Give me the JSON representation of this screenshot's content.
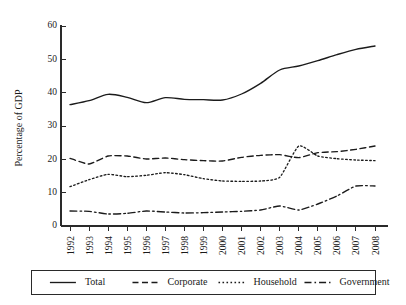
{
  "chart_data": {
    "type": "line",
    "title": "",
    "subtitle": "",
    "xlabel": "",
    "ylabel": "Percentage of GDP",
    "xlim": [
      1992,
      2008
    ],
    "ylim": [
      0,
      60
    ],
    "yticks": [
      0,
      10,
      20,
      30,
      40,
      50,
      60
    ],
    "ytick_labels": [
      "0",
      "10",
      "20",
      "30",
      "40",
      "50",
      "60"
    ],
    "grid": false,
    "legend_position": "bottom",
    "x": [
      1992,
      1993,
      1994,
      1995,
      1996,
      1997,
      1998,
      1999,
      2000,
      2001,
      2002,
      2003,
      2004,
      2005,
      2006,
      2007,
      2008
    ],
    "categories": [
      "1992",
      "1993",
      "1994",
      "1995",
      "1996",
      "1997",
      "1998",
      "1999",
      "2000",
      "2001",
      "2002",
      "2003",
      "2004",
      "2005",
      "2006",
      "2007",
      "2008"
    ],
    "series": [
      {
        "name": "Total",
        "dash_style": "solid",
        "color": "#1b1b1b",
        "values": [
          36.4,
          37.6,
          39.5,
          38.6,
          37.0,
          38.5,
          38.0,
          37.9,
          37.8,
          39.6,
          42.8,
          46.8,
          48.0,
          49.6,
          51.4,
          53.0,
          54.0
        ]
      },
      {
        "name": "Corporate",
        "dash_style": "dashed",
        "color": "#1b1b1b",
        "values": [
          20.3,
          18.6,
          21.0,
          21.0,
          20.1,
          20.4,
          19.9,
          19.6,
          19.5,
          20.6,
          21.2,
          21.4,
          20.5,
          22.0,
          22.3,
          23.0,
          24.0
        ]
      },
      {
        "name": "Household",
        "dash_style": "dotted",
        "color": "#1b1b1b",
        "values": [
          11.8,
          13.9,
          15.5,
          14.8,
          15.2,
          16.0,
          15.4,
          14.2,
          13.5,
          13.4,
          13.5,
          14.6,
          24.0,
          21.0,
          20.2,
          19.8,
          19.6
        ]
      },
      {
        "name": "Government",
        "dash_style": "dashdot",
        "color": "#1b1b1b",
        "values": [
          4.5,
          4.4,
          3.6,
          3.8,
          4.5,
          4.2,
          3.9,
          4.0,
          4.2,
          4.4,
          4.8,
          6.0,
          4.8,
          6.6,
          9.0,
          12.0,
          12.0
        ]
      }
    ],
    "legend": [
      {
        "label": "Total",
        "dash_style": "solid"
      },
      {
        "label": "Corporate",
        "dash_style": "dashed"
      },
      {
        "label": "Household",
        "dash_style": "dotted"
      },
      {
        "label": "Government",
        "dash_style": "dashdot"
      }
    ]
  }
}
